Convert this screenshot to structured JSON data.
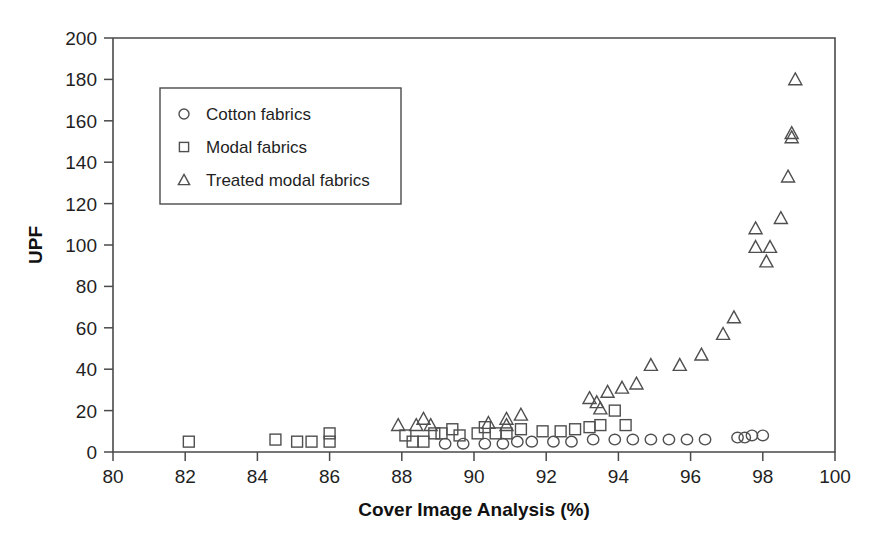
{
  "chart_data": {
    "type": "scatter",
    "title": "",
    "xlabel": "Cover Image Analysis (%)",
    "ylabel": "UPF",
    "xlim": [
      80,
      100
    ],
    "ylim": [
      0,
      200
    ],
    "xticks": [
      80,
      82,
      84,
      86,
      88,
      90,
      92,
      94,
      96,
      98,
      100
    ],
    "yticks": [
      0,
      20,
      40,
      60,
      80,
      100,
      120,
      140,
      160,
      180,
      200
    ],
    "grid": false,
    "legend_position": "top-left-inside",
    "series": [
      {
        "name": "Cotton fabrics",
        "marker": "circle",
        "points": [
          [
            89.2,
            4
          ],
          [
            89.7,
            4
          ],
          [
            90.3,
            4
          ],
          [
            90.8,
            4
          ],
          [
            91.2,
            5
          ],
          [
            91.6,
            5
          ],
          [
            92.2,
            5
          ],
          [
            92.7,
            5
          ],
          [
            93.3,
            6
          ],
          [
            93.9,
            6
          ],
          [
            94.4,
            6
          ],
          [
            94.9,
            6
          ],
          [
            95.4,
            6
          ],
          [
            95.9,
            6
          ],
          [
            96.4,
            6
          ],
          [
            97.3,
            7
          ],
          [
            97.5,
            7
          ],
          [
            97.7,
            8
          ],
          [
            98.0,
            8
          ]
        ]
      },
      {
        "name": "Modal fabrics",
        "marker": "square",
        "points": [
          [
            82.1,
            5
          ],
          [
            84.5,
            6
          ],
          [
            85.1,
            5
          ],
          [
            85.5,
            5
          ],
          [
            86.0,
            5
          ],
          [
            86.0,
            9
          ],
          [
            88.1,
            8
          ],
          [
            88.3,
            5
          ],
          [
            88.6,
            5
          ],
          [
            88.9,
            9
          ],
          [
            89.1,
            9
          ],
          [
            89.4,
            11
          ],
          [
            89.6,
            8
          ],
          [
            90.1,
            9
          ],
          [
            90.3,
            12
          ],
          [
            90.6,
            9
          ],
          [
            90.9,
            9
          ],
          [
            91.3,
            11
          ],
          [
            91.9,
            10
          ],
          [
            92.4,
            10
          ],
          [
            92.8,
            11
          ],
          [
            93.2,
            12
          ],
          [
            93.5,
            13
          ],
          [
            93.9,
            20
          ],
          [
            94.2,
            13
          ]
        ]
      },
      {
        "name": "Treated modal fabrics",
        "marker": "triangle",
        "points": [
          [
            87.9,
            13
          ],
          [
            88.4,
            13
          ],
          [
            88.6,
            16
          ],
          [
            88.8,
            13
          ],
          [
            90.4,
            14
          ],
          [
            90.9,
            16
          ],
          [
            90.9,
            13
          ],
          [
            91.3,
            18
          ],
          [
            93.2,
            26
          ],
          [
            93.4,
            24
          ],
          [
            93.5,
            21
          ],
          [
            93.7,
            29
          ],
          [
            94.1,
            31
          ],
          [
            94.5,
            33
          ],
          [
            94.9,
            42
          ],
          [
            95.7,
            42
          ],
          [
            96.3,
            47
          ],
          [
            96.9,
            57
          ],
          [
            97.2,
            65
          ],
          [
            97.8,
            108
          ],
          [
            97.8,
            99
          ],
          [
            98.2,
            99
          ],
          [
            98.1,
            92
          ],
          [
            98.5,
            113
          ],
          [
            98.7,
            133
          ],
          [
            98.8,
            154
          ],
          [
            98.8,
            152
          ],
          [
            98.9,
            180
          ]
        ]
      }
    ]
  },
  "legend": {
    "entries": [
      {
        "label": "Cotton fabrics",
        "marker": "circle-icon"
      },
      {
        "label": "Modal fabrics",
        "marker": "square-icon"
      },
      {
        "label": "Treated modal fabrics",
        "marker": "triangle-icon"
      }
    ]
  }
}
